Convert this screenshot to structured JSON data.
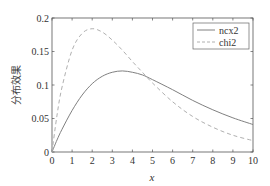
{
  "chart_data": {
    "type": "line",
    "title": "",
    "xlabel": "x",
    "ylabel": "分布效果",
    "xlim": [
      0,
      10
    ],
    "ylim": [
      0,
      0.2
    ],
    "xticks": [
      0,
      1,
      2,
      3,
      4,
      5,
      6,
      7,
      8,
      9,
      10
    ],
    "yticks": [
      0,
      0.05,
      0.1,
      0.15,
      0.2
    ],
    "ytick_labels": [
      "0",
      "0.05",
      "0.1",
      "0.15",
      "0.2"
    ],
    "grid": false,
    "legend_position": "upper right",
    "series": [
      {
        "name": "ncx2",
        "style": "solid",
        "color": "#808080",
        "x": [
          0,
          0.25,
          0.5,
          1,
          1.5,
          2,
          2.5,
          3,
          3.5,
          4,
          4.5,
          5,
          6,
          7,
          8,
          9,
          10
        ],
        "y": [
          0,
          0.018,
          0.034,
          0.062,
          0.085,
          0.102,
          0.113,
          0.119,
          0.121,
          0.119,
          0.115,
          0.108,
          0.093,
          0.077,
          0.063,
          0.051,
          0.041
        ]
      },
      {
        "name": "chi2",
        "style": "dashed",
        "color": "#b0b0b0",
        "x": [
          0,
          0.25,
          0.5,
          1,
          1.5,
          2,
          2.5,
          3,
          3.5,
          4,
          4.5,
          5,
          6,
          7,
          8,
          9,
          10
        ],
        "y": [
          0,
          0.055,
          0.097,
          0.152,
          0.177,
          0.184,
          0.179,
          0.167,
          0.152,
          0.135,
          0.119,
          0.103,
          0.075,
          0.053,
          0.037,
          0.025,
          0.017
        ]
      }
    ]
  },
  "legend": {
    "items": [
      {
        "label": "ncx2",
        "style": "solid"
      },
      {
        "label": "chi2",
        "style": "dashed"
      }
    ]
  }
}
